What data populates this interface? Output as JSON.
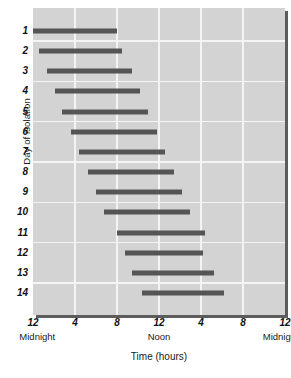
{
  "chart_data": {
    "type": "bar",
    "orientation": "horizontal",
    "title": "",
    "xlabel": "Time (hours)",
    "ylabel": "Day of isolation",
    "xlim": [
      0,
      24
    ],
    "ylim": [
      0.5,
      14.5
    ],
    "grid": true,
    "legend": null,
    "x_tick_values": [
      0,
      4,
      8,
      12,
      16,
      20,
      24
    ],
    "x_tick_labels": [
      "12",
      "4",
      "8",
      "12",
      "4",
      "8",
      "12"
    ],
    "x_sublabels": [
      {
        "value": 0,
        "label": "Midnight"
      },
      {
        "value": 12,
        "label": "Noon"
      },
      {
        "value": 24,
        "label": "Midnight"
      }
    ],
    "categories": [
      "1",
      "2",
      "3",
      "4",
      "5",
      "6",
      "7",
      "8",
      "9",
      "10",
      "11",
      "12",
      "13",
      "14"
    ],
    "bars": [
      {
        "day": "1",
        "start": 0.0,
        "end": 8.0
      },
      {
        "day": "2",
        "start": 0.6,
        "end": 8.5
      },
      {
        "day": "3",
        "start": 1.3,
        "end": 9.4
      },
      {
        "day": "4",
        "start": 2.1,
        "end": 10.2
      },
      {
        "day": "5",
        "start": 2.8,
        "end": 11.0
      },
      {
        "day": "6",
        "start": 3.6,
        "end": 11.8
      },
      {
        "day": "7",
        "start": 4.4,
        "end": 12.6
      },
      {
        "day": "8",
        "start": 5.2,
        "end": 13.4
      },
      {
        "day": "9",
        "start": 6.0,
        "end": 14.2
      },
      {
        "day": "10",
        "start": 6.8,
        "end": 15.0
      },
      {
        "day": "11",
        "start": 8.0,
        "end": 16.4
      },
      {
        "day": "12",
        "start": 8.8,
        "end": 16.2
      },
      {
        "day": "13",
        "start": 9.4,
        "end": 17.2
      },
      {
        "day": "14",
        "start": 10.4,
        "end": 18.2
      }
    ],
    "colors": {
      "bar": "#555555",
      "plot_background": "#d3d3d3",
      "gridline": "#f4f4f4",
      "text": "#1a1a1a"
    }
  }
}
